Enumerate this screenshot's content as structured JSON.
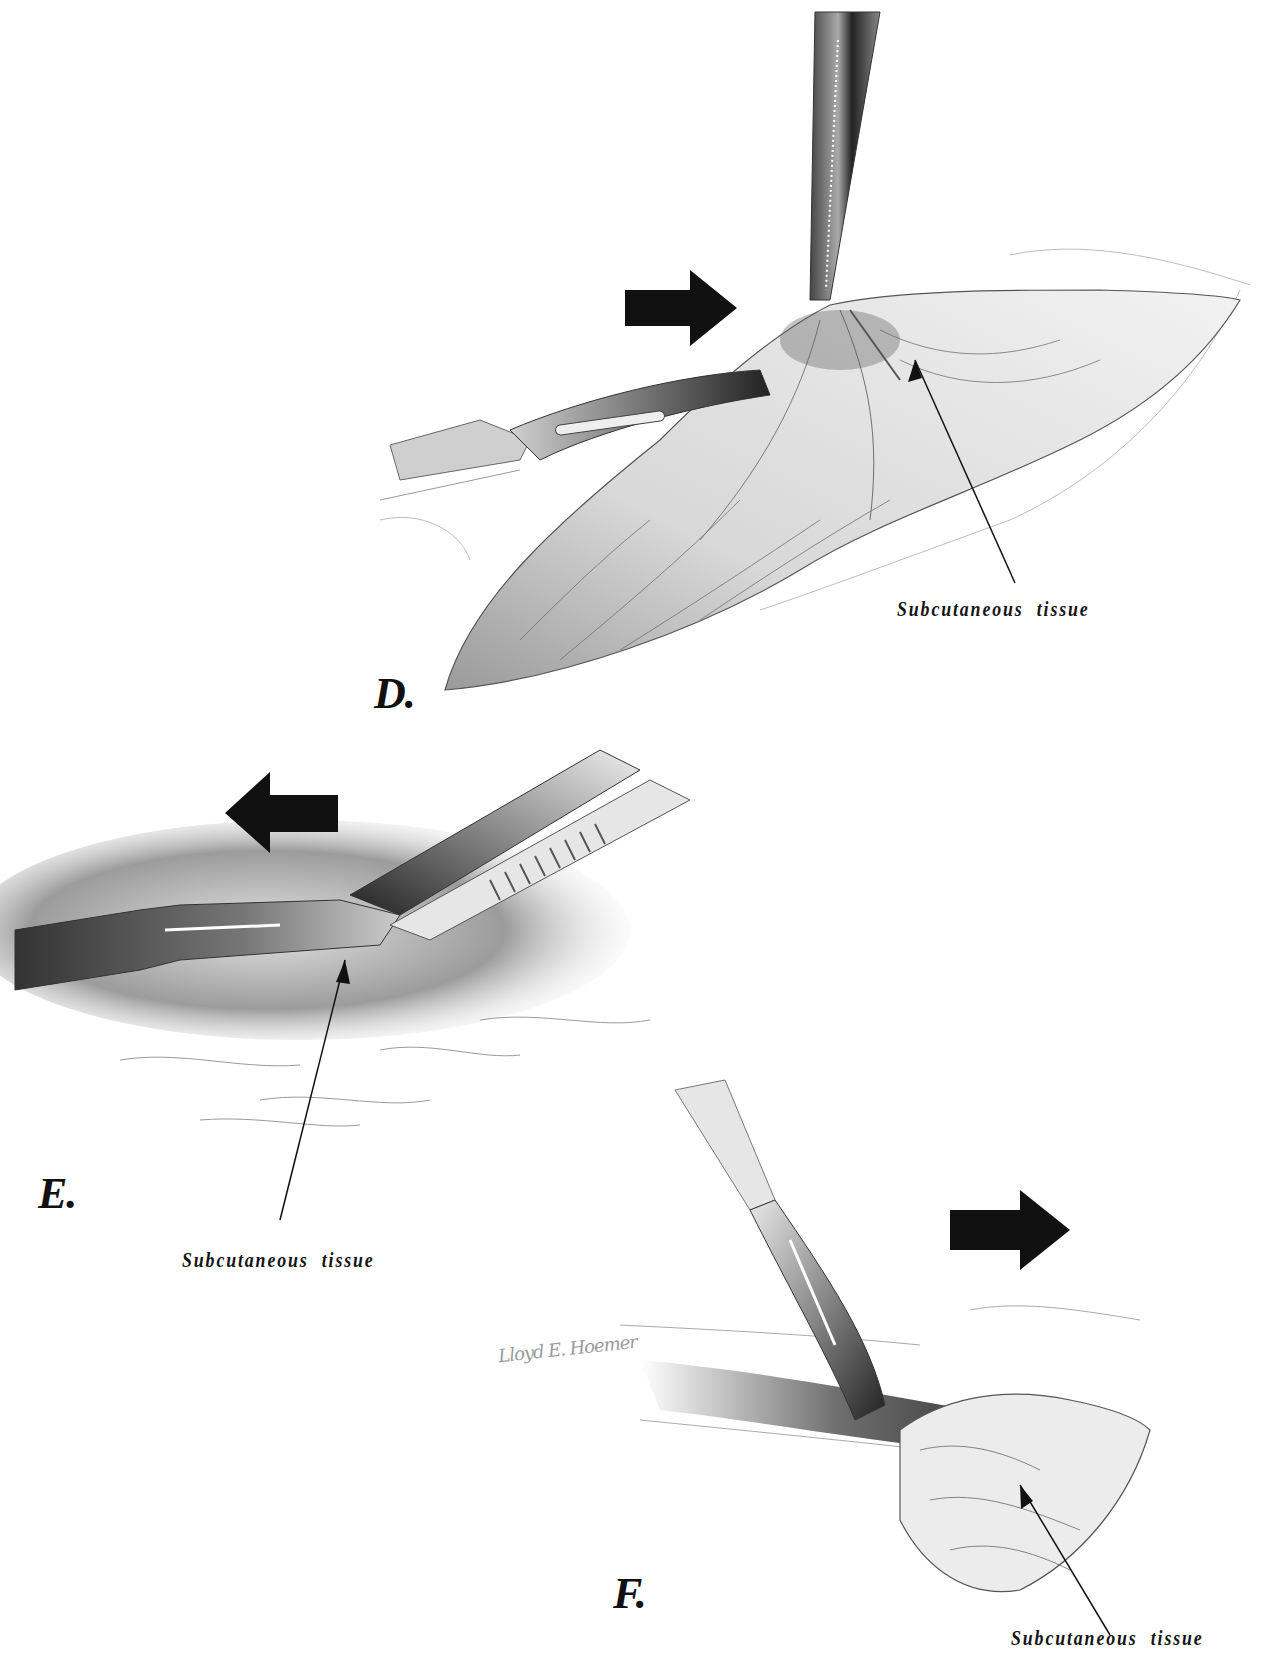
{
  "figure": {
    "panels": [
      {
        "id": "D",
        "letter": "D.",
        "label": "Subcutaneous tissue",
        "direction_arrow": "right",
        "instruments": [
          "scalpel",
          "toothed-forceps"
        ]
      },
      {
        "id": "E",
        "letter": "E.",
        "label": "Subcutaneous tissue",
        "direction_arrow": "left",
        "instruments": [
          "scalpel",
          "toothed-forceps"
        ]
      },
      {
        "id": "F",
        "letter": "F.",
        "label": "Subcutaneous tissue",
        "direction_arrow": "right",
        "instruments": [
          "scalpel",
          "retractor"
        ]
      }
    ],
    "signature": "Lloyd E. Hoemer",
    "colors": {
      "ink": "#111111",
      "shade_dark": "#3a3a3a",
      "shade_mid": "#8a8a8a",
      "shade_light": "#cfcfcf",
      "background": "#ffffff"
    }
  }
}
